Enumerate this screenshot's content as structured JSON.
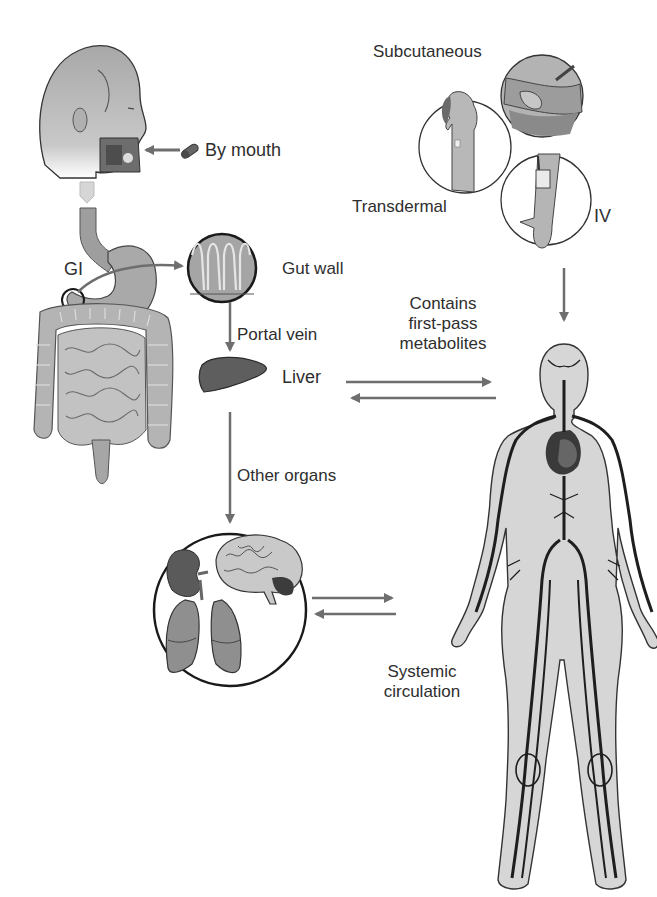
{
  "diagram": {
    "colors": {
      "arrow": "#6e6e6e",
      "outline": "#2b2b2b",
      "skin_fill": "#c9c9c9",
      "organ_fill": "#8f8f8f",
      "liver_fill": "#5e5e5e",
      "vessel": "#1e1e1e",
      "body_fill": "#d6d6d6"
    },
    "labels": {
      "by_mouth": "By mouth",
      "gi": "GI",
      "gut_wall": "Gut wall",
      "portal_vein": "Portal vein",
      "liver": "Liver",
      "other_organs": "Other organs",
      "contains_line1": "Contains",
      "contains_line2": "first-pass",
      "contains_line3": "metabolites",
      "subcutaneous": "Subcutaneous",
      "transdermal": "Transdermal",
      "iv": "IV",
      "systemic_line1": "Systemic",
      "systemic_line2": "circulation"
    },
    "nodes": [
      {
        "id": "head",
        "label": "By mouth"
      },
      {
        "id": "gi_tract",
        "label": "GI"
      },
      {
        "id": "gut_wall",
        "label": "Gut wall"
      },
      {
        "id": "liver",
        "label": "Liver"
      },
      {
        "id": "other_organs",
        "label": "Other organs"
      },
      {
        "id": "subcutaneous",
        "label": "Subcutaneous"
      },
      {
        "id": "transdermal",
        "label": "Transdermal"
      },
      {
        "id": "iv",
        "label": "IV"
      },
      {
        "id": "systemic_circulation",
        "label": "Systemic circulation"
      }
    ],
    "edges": [
      {
        "from": "pill",
        "to": "head",
        "label": "By mouth"
      },
      {
        "from": "gi_tract",
        "to": "gut_wall",
        "label": ""
      },
      {
        "from": "gut_wall",
        "to": "liver",
        "label": "Portal vein"
      },
      {
        "from": "liver",
        "to": "systemic_circulation",
        "label": "Contains first-pass metabolites"
      },
      {
        "from": "systemic_circulation",
        "to": "liver",
        "label": ""
      },
      {
        "from": "liver",
        "to": "other_organs",
        "label": "Other organs"
      },
      {
        "from": "other_organs",
        "to": "systemic_circulation",
        "label": ""
      },
      {
        "from": "systemic_circulation",
        "to": "other_organs",
        "label": ""
      },
      {
        "from": "parenteral_routes",
        "to": "systemic_circulation",
        "label": ""
      }
    ]
  }
}
